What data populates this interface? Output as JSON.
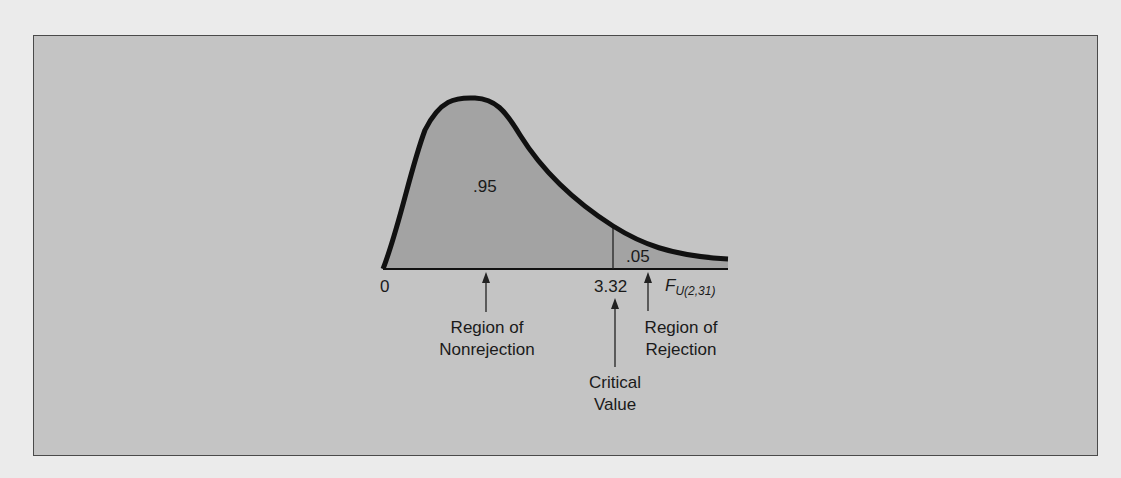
{
  "figure": {
    "type": "F-distribution rejection region diagram",
    "distribution_label": "F",
    "distribution_subscript": "U(2,31)",
    "axis_origin_label": "0",
    "critical_value": "3.32",
    "areas": {
      "nonrejection": ".95",
      "rejection": ".05"
    },
    "annotations": {
      "nonrejection_line1": "Region of",
      "nonrejection_line2": "Nonrejection",
      "rejection_line1": "Region of",
      "rejection_line2": "Rejection",
      "critical_line1": "Critical",
      "critical_line2": "Value"
    },
    "colors": {
      "background": "#ebebeb",
      "panel": "#c4c4c4",
      "shaded_area": "#a5a5a5",
      "curve": "#111111"
    }
  }
}
